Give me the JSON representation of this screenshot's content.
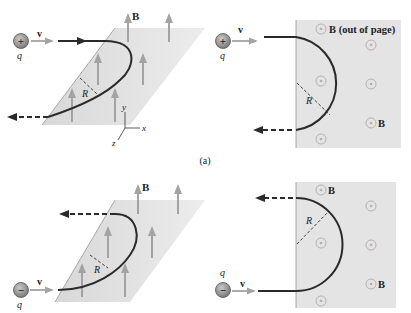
{
  "figure": {
    "caption": "(a)",
    "colors": {
      "plane_fill": "#e2e2e2",
      "field_arrow": "#a3a3a3",
      "path_stroke": "#2a2a2a",
      "charge_fill": "#8e8e8e",
      "dot_ring": "#b7a8a8"
    },
    "panels": [
      {
        "id": "top-left",
        "view": "perspective",
        "charge_sign": "+",
        "charge_label": "q",
        "velocity_label": "v",
        "field_label": "B",
        "radius_label": "R",
        "axis_labels": {
          "x": "x",
          "y": "y",
          "z": "z"
        }
      },
      {
        "id": "top-right",
        "view": "top",
        "charge_sign": "+",
        "charge_label": "q",
        "velocity_label": "v",
        "field_label_top": "B (out of page)",
        "field_label_bottom": "B",
        "radius_label": "R"
      },
      {
        "id": "bottom-left",
        "view": "perspective",
        "charge_sign": "−",
        "charge_label": "q",
        "velocity_label": "v",
        "field_label": "B",
        "radius_label": "R"
      },
      {
        "id": "bottom-right",
        "view": "top",
        "charge_sign": "−",
        "charge_label": "q",
        "velocity_label": "v",
        "field_label_top": "B",
        "field_label_bottom": "B",
        "radius_label": "R"
      }
    ]
  }
}
